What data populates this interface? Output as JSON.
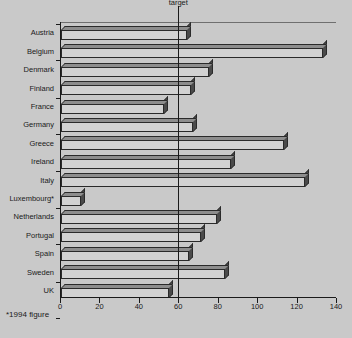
{
  "footnote": "*1994 figure",
  "source_note": "",
  "chart_data": {
    "type": "bar",
    "orientation": "horizontal",
    "title": "",
    "subtitle": "",
    "xlabel": "",
    "ylabel": "",
    "xlim": [
      0,
      140
    ],
    "ylim": null,
    "grid": false,
    "legend": null,
    "xticks": [
      0,
      20,
      40,
      60,
      80,
      100,
      120,
      140
    ],
    "categories": [
      "Austria",
      "Belgium",
      "Denmark",
      "Finland",
      "France",
      "Germany",
      "Greece",
      "Ireland",
      "Italy",
      "Luxembourg*",
      "Netherlands",
      "Portugal",
      "Spain",
      "Sweden",
      "UK"
    ],
    "values": [
      64,
      133,
      75,
      66,
      52,
      67,
      113,
      86,
      124,
      10,
      79,
      71,
      65,
      83,
      55
    ],
    "annotations": [
      {
        "label": "target",
        "type": "vline",
        "value": 60
      }
    ],
    "style": {
      "bar_face": "#d2d2d2",
      "bar_top": "#8d8d8d",
      "bar_side": "#4a4a4a",
      "bar_edge": "#2a2a2a",
      "background": "#c9c9c9",
      "axis": "#1a1a1a"
    }
  }
}
